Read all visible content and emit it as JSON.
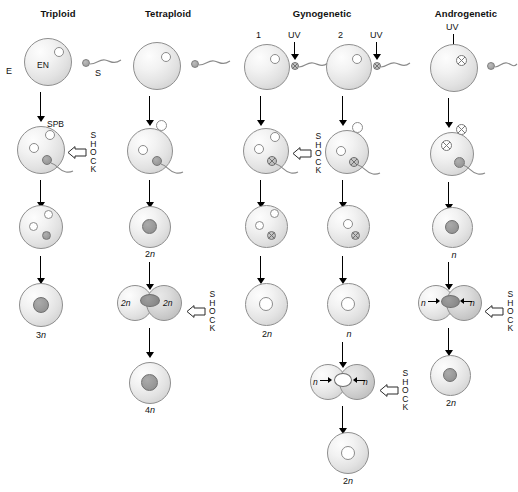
{
  "figure": {
    "columns": [
      {
        "id": "triploid",
        "title": "Triploid"
      },
      {
        "id": "tetraploid",
        "title": "Tetraploid"
      },
      {
        "id": "gynogenetic",
        "title": "Gynogenetic"
      },
      {
        "id": "androgenetic",
        "title": "Androgenetic"
      }
    ],
    "labels": {
      "egg": "E",
      "sperm": "S",
      "spb": "SPB",
      "uv": "UV",
      "branch_1": "1",
      "branch_2": "2",
      "shock": "SHOCK",
      "shock_letters": [
        "S",
        "H",
        "O",
        "C",
        "K"
      ]
    },
    "ploidy": {
      "n": "n",
      "2n": "2n",
      "3n": "3n",
      "4n": "4n"
    },
    "triploid": {
      "title": "Triploid",
      "egg_label": "E",
      "sperm_label": "S",
      "spb_label": "SPB",
      "egg_nucleus_label": "EN",
      "shock_label": "SHOCK",
      "result": "3n"
    },
    "tetraploid": {
      "title": "Tetraploid",
      "zygote": "2n",
      "lobe_left": "2n",
      "lobe_right": "2n",
      "shock_label": "SHOCK",
      "result": "4n"
    },
    "gynogenetic": {
      "title": "Gynogenetic",
      "branch1": {
        "number": "1",
        "uv": "UV",
        "shock_label": "SHOCK",
        "result": "2n"
      },
      "branch2": {
        "number": "2",
        "uv": "UV",
        "intermediate": "n",
        "lobe_left": "n",
        "lobe_right": "n",
        "shock_label": "SHOCK",
        "result": "2n"
      }
    },
    "androgenetic": {
      "title": "Androgenetic",
      "uv": "UV",
      "intermediate": "n",
      "lobe_left": "n",
      "lobe_right": "n",
      "shock_label": "SHOCK",
      "result": "2n"
    },
    "colors": {
      "background": "#ffffff",
      "ink": "#111111",
      "cell_outline": "#8e8e8e",
      "nucleus_fill": "#ffffff",
      "sperm_nucleus_fill": "#9d9d9d"
    }
  }
}
